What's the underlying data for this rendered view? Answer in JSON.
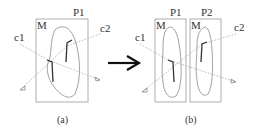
{
  "figure": {
    "panel_a": {
      "caption": "(a)",
      "partition_label": "P1",
      "mesh_label": "M",
      "cut1_label": "c1",
      "cut2_label": "c2"
    },
    "transition_arrow": "right-arrow-icon",
    "panel_b": {
      "caption": "(b)",
      "partition1_label": "P1",
      "partition2_label": "P2",
      "mesh1_label": "M",
      "mesh2_label": "M",
      "cut1_label": "c1",
      "cut2_label": "c2"
    },
    "colors": {
      "box": "#9a9a9a",
      "outline": "#8a8a8a",
      "dashed": "#9a9a9a",
      "segment": "#333333",
      "arrow": "#111111"
    }
  }
}
